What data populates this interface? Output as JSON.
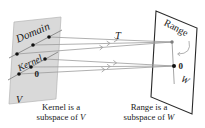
{
  "figure": {
    "title_meaning": "Kernel and range of a linear transformation T from V to W",
    "labels": {
      "domain": "Domain",
      "kernel": "Kernel",
      "zero_left": "0",
      "space_v": "V",
      "transformation": "T",
      "range": "Range",
      "zero_right": "0",
      "space_w": "W"
    },
    "captions": {
      "left": {
        "line1": "Kernel is a",
        "line2_text": "subspace of",
        "line2_var": "V"
      },
      "right": {
        "line1": "Range is a",
        "line2_text": "subspace of",
        "line2_var": "W"
      }
    },
    "colors": {
      "background": "#ffffff",
      "left_plane_fill": "#d9d9d9",
      "right_plane_fill": "#ffffff",
      "plane_edge_dark": "#2a2a2a",
      "subspace_line_gray": "#8f8f8f",
      "arrow_gray": "#9c9c9c",
      "point_black": "#111111",
      "point_gray": "#7d7d7d",
      "text_ink": "#1a1a1a"
    }
  }
}
